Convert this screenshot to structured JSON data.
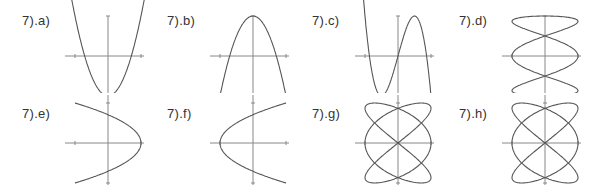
{
  "chart_data": [
    {
      "type": "line",
      "id": "a",
      "label": "7).a)",
      "title": "7).a)",
      "curve": "y = 2x^2 - 1",
      "kind": "function",
      "xlim": [
        -1.5,
        1.5
      ],
      "ylim": [
        -1.2,
        1.2
      ],
      "ticks": {
        "x": [
          -1,
          1
        ],
        "y": [
          1,
          -1
        ]
      },
      "grid": false
    },
    {
      "type": "line",
      "id": "b",
      "label": "7).b)",
      "title": "7).b)",
      "curve": "y = 1 - 2x^2",
      "kind": "function",
      "xlim": [
        -1.5,
        1.5
      ],
      "ylim": [
        -1.2,
        1.2
      ],
      "ticks": {
        "x": [
          -1,
          1
        ],
        "y": [
          1,
          -1
        ]
      },
      "grid": false
    },
    {
      "type": "line",
      "id": "c",
      "label": "7).c)",
      "title": "7).c)",
      "curve": "y = 3x - 4x^3",
      "kind": "function",
      "xlim": [
        -1.5,
        1.5
      ],
      "ylim": [
        -1.2,
        1.2
      ],
      "ticks": {
        "x": [
          -1,
          1
        ],
        "y": [
          1,
          -1
        ]
      },
      "grid": false
    },
    {
      "type": "line",
      "id": "d",
      "label": "7).d)",
      "title": "7).d)",
      "curve": "x = sin(3t), y = cos(t)",
      "kind": "parametric",
      "xlim": [
        -1.5,
        1.5
      ],
      "ylim": [
        -1.2,
        1.2
      ],
      "ticks": {
        "x": [
          -1,
          1
        ],
        "y": [
          1,
          -1
        ]
      },
      "grid": false
    },
    {
      "type": "line",
      "id": "e",
      "label": "7).e)",
      "title": "7).e)",
      "curve": "x = cos(2t), y = sin(t)... loop crossing at (-1/2,0)",
      "kind": "parametric",
      "xlim": [
        -1.5,
        1.5
      ],
      "ylim": [
        -1.2,
        1.2
      ],
      "ticks": {
        "x": [
          -1,
          1
        ],
        "y": [
          1,
          -1
        ]
      },
      "grid": false
    },
    {
      "type": "line",
      "id": "f",
      "label": "7).f)",
      "title": "7).f)",
      "curve": "mirror of e: loop crossing at (1/2,0)",
      "kind": "parametric",
      "xlim": [
        -1.5,
        1.5
      ],
      "ylim": [
        -1.2,
        1.2
      ],
      "ticks": {
        "x": [
          -1,
          1
        ],
        "y": [
          1,
          -1
        ]
      },
      "grid": false
    },
    {
      "type": "line",
      "id": "g",
      "label": "7).g)",
      "title": "7).g)",
      "curve": "x = sin(3t), y = sin(2t)-type Lissajous",
      "kind": "parametric",
      "xlim": [
        -1.5,
        1.5
      ],
      "ylim": [
        -1.2,
        1.2
      ],
      "ticks": {
        "x": [
          -1,
          1
        ],
        "y": [
          1,
          -1
        ]
      },
      "grid": false
    },
    {
      "type": "line",
      "id": "h",
      "label": "7).h)",
      "title": "7).h)",
      "curve": "x = sin(3t), y = sin(2t)-type Lissajous",
      "kind": "parametric",
      "xlim": [
        -1.5,
        1.5
      ],
      "ylim": [
        -1.2,
        1.2
      ],
      "ticks": {
        "x": [
          -1,
          1
        ],
        "y": [
          1,
          -1
        ]
      },
      "grid": false
    }
  ]
}
